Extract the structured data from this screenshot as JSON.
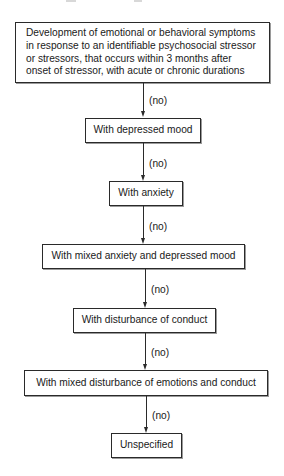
{
  "diagram": {
    "type": "flowchart",
    "direction": "top-to-bottom",
    "colors": {
      "border": "#2a2a2a",
      "text": "#1a1a1a",
      "background": "#ffffff"
    },
    "root": {
      "lines": [
        "Development of emotional or behavioral symptoms",
        "in response to an identifiable psychosocial stressor",
        "or stressors, that occurs within 3 months after",
        "onset of stressor, with acute or chronic durations"
      ]
    },
    "nodes": [
      {
        "label": "With depressed mood"
      },
      {
        "label": "With anxiety"
      },
      {
        "label": "With mixed anxiety and depressed mood"
      },
      {
        "label": "With disturbance of conduct"
      },
      {
        "label": "With mixed disturbance of emotions and conduct"
      },
      {
        "label": "Unspecified"
      }
    ],
    "edges": [
      {
        "from": "root",
        "to": "With depressed mood",
        "label": "(no)"
      },
      {
        "from": "With depressed mood",
        "to": "With anxiety",
        "label": "(no)"
      },
      {
        "from": "With anxiety",
        "to": "With mixed anxiety and depressed mood",
        "label": "(no)"
      },
      {
        "from": "With mixed anxiety and depressed mood",
        "to": "With disturbance of conduct",
        "label": "(no)"
      },
      {
        "from": "With disturbance of conduct",
        "to": "With mixed disturbance of emotions and conduct",
        "label": "(no)"
      },
      {
        "from": "With mixed disturbance of emotions and conduct",
        "to": "Unspecified",
        "label": "(no)"
      }
    ]
  }
}
